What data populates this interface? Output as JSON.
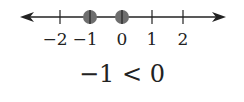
{
  "number_line": {
    "ticks": [
      {
        "value": -2,
        "label": "−2",
        "x": 60
      },
      {
        "value": -1,
        "label": "−1",
        "x": 90
      },
      {
        "value": 0,
        "label": "0",
        "x": 122
      },
      {
        "value": 1,
        "label": "1",
        "x": 152
      },
      {
        "value": 2,
        "label": "2",
        "x": 183
      }
    ],
    "points": [
      {
        "value": -1,
        "x": 90
      },
      {
        "value": 0,
        "x": 122
      }
    ],
    "colors": {
      "line": "#222222",
      "dot": "#6e6e6e"
    }
  },
  "caption": "−1 < 0"
}
